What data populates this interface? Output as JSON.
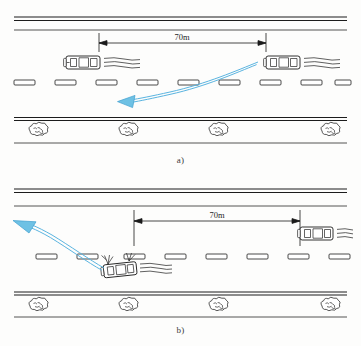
{
  "figure": {
    "top_note": "",
    "width": 361,
    "height": 346,
    "colors": {
      "arrow_fill": "#6ec1e4",
      "arrow_stroke": "#3f9fd0",
      "line_black": "#1c1c1c",
      "paper": "#fdfdfc"
    }
  },
  "panels": [
    {
      "id": "a",
      "caption": "a)",
      "dimension_label": "70m",
      "description": "Two cars traveling in same lane separated by 70m; trailing vehicle swerves left",
      "vehicles": [
        {
          "name": "lead-car",
          "state": "moving",
          "heading": "left",
          "speed_lines": 3
        },
        {
          "name": "following-car",
          "state": "moving",
          "heading": "left",
          "speed_lines": 3
        }
      ],
      "lane_marks": 8,
      "bushes": 4,
      "maneuver_arrow": "curve-left-down"
    },
    {
      "id": "b",
      "caption": "b)",
      "dimension_label": "70m",
      "description": "Crashed vehicle at left; second vehicle 70m behind; evasive path arrow exits to upper left",
      "vehicles": [
        {
          "name": "crashed-car",
          "state": "crashed",
          "heading": "left",
          "speed_lines": 3
        },
        {
          "name": "approaching-car",
          "state": "moving",
          "heading": "left",
          "speed_lines": 3
        }
      ],
      "lane_marks": 8,
      "bushes": 4,
      "maneuver_arrow": "curve-up-left"
    }
  ]
}
